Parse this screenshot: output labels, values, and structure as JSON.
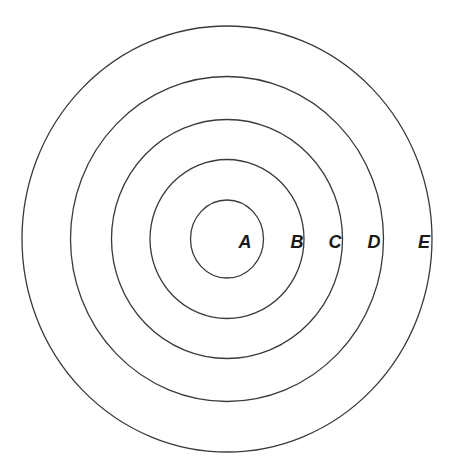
{
  "diagram": {
    "type": "concentric-circles",
    "center": {
      "x": 227,
      "y": 239
    },
    "stroke_color": "#3a3a3a",
    "label_color": "#1a1a1a",
    "background": "#ffffff",
    "rings": [
      {
        "id": "A",
        "label": "A",
        "rx": 36.5,
        "ry": 39,
        "label_x": 245,
        "label_y": 248
      },
      {
        "id": "B",
        "label": "B",
        "rx": 77,
        "ry": 79.5,
        "label_x": 297,
        "label_y": 248
      },
      {
        "id": "C",
        "label": "C",
        "rx": 115.5,
        "ry": 119.5,
        "label_x": 335,
        "label_y": 248
      },
      {
        "id": "D",
        "label": "D",
        "rx": 156.5,
        "ry": 162.5,
        "label_x": 374,
        "label_y": 248
      },
      {
        "id": "E",
        "label": "E",
        "rx": 205,
        "ry": 213,
        "label_x": 424,
        "label_y": 248
      }
    ]
  }
}
